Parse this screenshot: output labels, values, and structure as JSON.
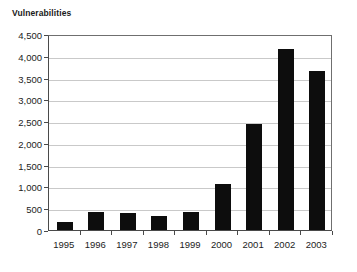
{
  "chart_data": {
    "type": "bar",
    "title": "Vulnerabilities",
    "xlabel": "",
    "ylabel": "",
    "categories": [
      "1995",
      "1996",
      "1997",
      "1998",
      "1999",
      "2000",
      "2001",
      "2002",
      "2003"
    ],
    "values": [
      180,
      410,
      390,
      330,
      420,
      1050,
      2440,
      4150,
      3650
    ],
    "ylim": [
      0,
      4500
    ],
    "ytick_values": [
      0,
      500,
      1000,
      1500,
      2000,
      2500,
      3000,
      3500,
      4000,
      4500
    ],
    "ytick_labels": [
      "0",
      "500",
      "1,000",
      "1,500",
      "2,000",
      "2,500",
      "3,000",
      "3,500",
      "4,000",
      "4,500"
    ],
    "grid": true,
    "legend": null,
    "bar_color": "#0d0d0d",
    "gridline_color": "#c9c9c9",
    "axis_color": "#4a4a4a",
    "background_color": "#ffffff"
  }
}
